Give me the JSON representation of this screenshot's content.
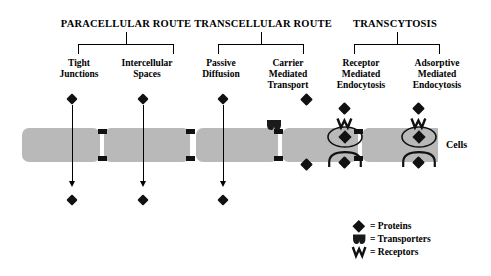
{
  "diagram": {
    "title_groups": [
      {
        "id": "paracellular",
        "label": "PARACELLULAR ROUTE",
        "children": [
          {
            "id": "tight-junctions",
            "lines": [
              "Tight",
              "Junctions"
            ]
          },
          {
            "id": "intercellular-spaces",
            "lines": [
              "Intercellular",
              "Spaces"
            ]
          }
        ]
      },
      {
        "id": "transcellular",
        "label": "TRANSCELLULAR ROUTE",
        "children": [
          {
            "id": "passive-diffusion",
            "lines": [
              "Passive",
              "Diffusion"
            ]
          },
          {
            "id": "carrier-mediated-transport",
            "lines": [
              "Carrier",
              "Mediated",
              "Transport"
            ]
          }
        ]
      },
      {
        "id": "transcytosis",
        "label": "TRANSCYTOSIS",
        "children": [
          {
            "id": "receptor-mediated-endocytosis",
            "lines": [
              "Receptor",
              "Mediated",
              "Endocytosis"
            ]
          },
          {
            "id": "adsorptive-mediated-endocytosis",
            "lines": [
              "Adsorptive",
              "Mediated",
              "Endocytosis"
            ]
          }
        ]
      }
    ],
    "cells_caption": "Cells",
    "legend": [
      {
        "id": "proteins",
        "glyph": "diamond-icon",
        "text": "= Proteins"
      },
      {
        "id": "transporters",
        "glyph": "transporter-icon",
        "text": "= Transporters"
      },
      {
        "id": "receptors",
        "glyph": "receptor-icon",
        "text": "= Receptors"
      }
    ],
    "colors": {
      "cell_fill": "#b9b9b9",
      "stroke": "#000000",
      "background": "#ffffff"
    }
  }
}
